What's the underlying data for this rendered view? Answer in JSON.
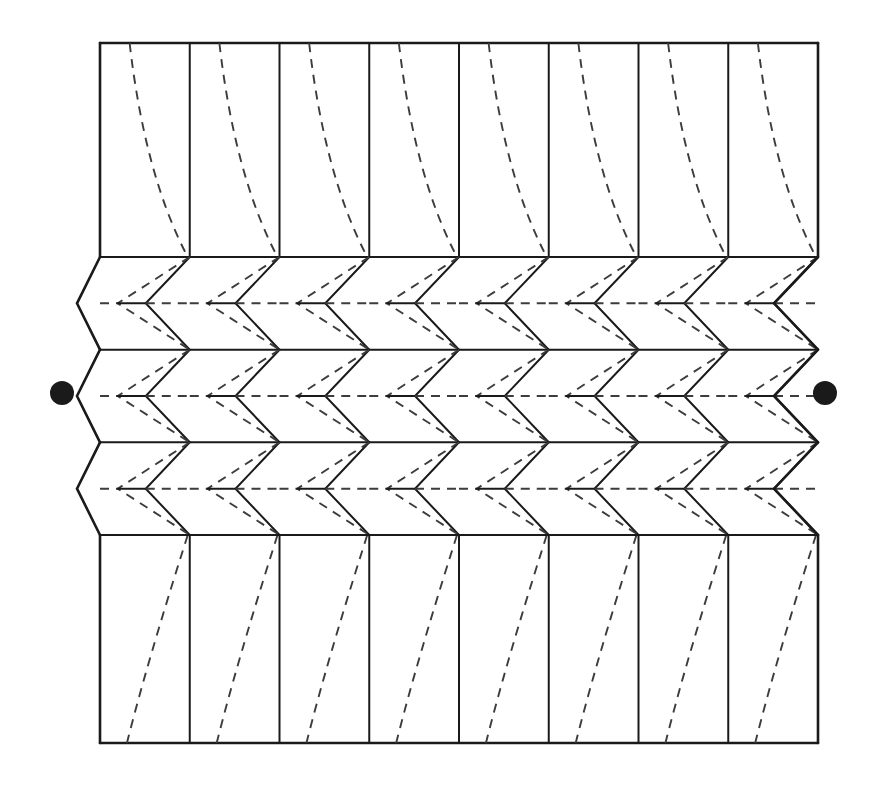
{
  "figure": {
    "canvas": {
      "width": 873,
      "height": 789,
      "background": "#ffffff"
    },
    "colors": {
      "solid_line": "#1a1a1a",
      "dashed_line": "#3c3c3c",
      "dot_fill": "#1a1a1a",
      "background": "#ffffff"
    },
    "line_styles": {
      "solid_label": "mountain-fold / visible edge",
      "dashed_label": "valley-fold / hidden edge",
      "solid_width": 2.0,
      "solid_width_outline": 2.6,
      "dashed_width": 1.9,
      "dash_pattern": "9,7"
    },
    "geometry": {
      "left_x": 100,
      "right_x": 818,
      "top_y": 43,
      "bottom_y": 743,
      "columns": 8,
      "column_step": 89.75,
      "column_lines_x": [
        100,
        189.75,
        279.5,
        369.25,
        459,
        548.75,
        638.5,
        728.25,
        818
      ],
      "band_top_y": 257,
      "band_bottom_y": 535,
      "rows": 3,
      "row_height": 92.7,
      "row_boundary_y": [
        257,
        349.7,
        442.3,
        535
      ],
      "mid_line_y": [
        303.3,
        396,
        488.7
      ],
      "edge_offset": 23,
      "chevron_depth": 44,
      "dashed_chevron_depth": 72
    },
    "markers": [
      {
        "name": "left-dot",
        "cx": 62,
        "cy": 393,
        "r": 12
      },
      {
        "name": "right-dot",
        "cx": 825,
        "cy": 393,
        "r": 12
      }
    ],
    "panels": {
      "top": {
        "label": "top flat panel",
        "y_from": 43,
        "y_to": 257,
        "dashed_curves": 8,
        "curve_direction": "upper-left to lower-right"
      },
      "bottom": {
        "label": "bottom flat panel",
        "y_from": 535,
        "y_to": 743,
        "dashed_curves": 8,
        "curve_direction": "upper-right to lower-left"
      }
    }
  }
}
